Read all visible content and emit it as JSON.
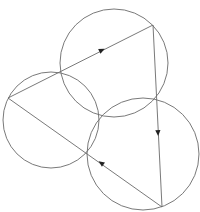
{
  "diagram": {
    "width": 200,
    "height": 212,
    "background": "#ffffff",
    "stroke_color": "#6a6a6a",
    "arrow_color": "#222222",
    "stroke_width": 0.9,
    "circles": [
      {
        "id": "top",
        "cx": 114,
        "cy": 63,
        "r": 54
      },
      {
        "id": "left",
        "cx": 51,
        "cy": 120,
        "r": 48
      },
      {
        "id": "bottom-right",
        "cx": 143,
        "cy": 154,
        "r": 56
      }
    ],
    "triangle": {
      "vertices": [
        {
          "id": "A",
          "x": 8,
          "y": 98
        },
        {
          "id": "B",
          "x": 153,
          "y": 25
        },
        {
          "id": "C",
          "x": 162,
          "y": 207
        }
      ],
      "edge_points": [
        {
          "id": "P_AB",
          "x": 61,
          "y": 72
        },
        {
          "id": "P_BC",
          "x": 157,
          "y": 98
        },
        {
          "id": "P_CA",
          "x": 87,
          "y": 153
        }
      ]
    },
    "common_point": {
      "x": 100,
      "y": 117
    },
    "arrows": [
      {
        "edge": "A-B",
        "x": 102,
        "y": 50,
        "direction": "toward B"
      },
      {
        "edge": "B-C",
        "x": 158,
        "y": 133,
        "direction": "toward C"
      },
      {
        "edge": "C-A",
        "x": 101,
        "y": 163,
        "direction": "toward A"
      }
    ]
  }
}
